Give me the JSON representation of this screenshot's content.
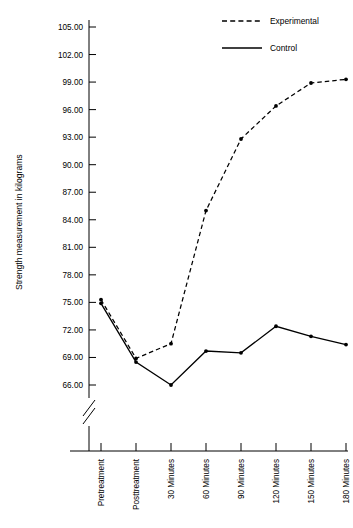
{
  "chart_data": {
    "type": "line",
    "title": "",
    "xlabel": "",
    "ylabel": "Strength measurement in kilograms",
    "categories": [
      "Pretreatment",
      "Posttreatment",
      "30 Minutes",
      "60 Minutes",
      "90 Minutes",
      "120 Minutes",
      "150 Minutes",
      "180 Minutes"
    ],
    "ytick_labels": [
      "66.00",
      "69.00",
      "72.00",
      "75.00",
      "78.00",
      "81.00",
      "84.00",
      "87.00",
      "90.00",
      "93.00",
      "96.00",
      "99.00",
      "102.00",
      "105.00"
    ],
    "ytick_values": [
      66,
      69,
      72,
      75,
      78,
      81,
      84,
      87,
      90,
      93,
      96,
      99,
      102,
      105
    ],
    "ylim": [
      66,
      105
    ],
    "y_axis_break": true,
    "grid": false,
    "legend_position": "top-right",
    "series": [
      {
        "name": "Experimental",
        "style": "dashed",
        "values": [
          75.3,
          68.9,
          70.5,
          85.0,
          92.8,
          96.4,
          98.9,
          99.3
        ]
      },
      {
        "name": "Control",
        "style": "solid",
        "values": [
          74.9,
          68.5,
          66.0,
          69.7,
          69.5,
          72.4,
          71.3,
          70.4
        ]
      }
    ]
  },
  "legend": {
    "items": [
      {
        "label": "Experimental",
        "style": "dashed"
      },
      {
        "label": "Control",
        "style": "solid"
      }
    ]
  }
}
